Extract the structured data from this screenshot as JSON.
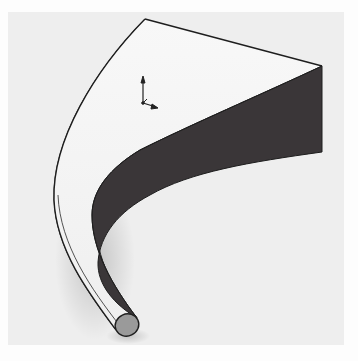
{
  "figure": {
    "background_color": "#fdfdfd",
    "viewport_color": "#eeeeee",
    "colors": {
      "top_face": "#f4f4f4",
      "side_face": "#3a3638",
      "outer_curved_face": "#d6d6d6",
      "tip_cap": "#9a9a9a",
      "edge": "#1e1e1e"
    },
    "triad": {
      "icon": "coordinate-triad-icon"
    }
  }
}
